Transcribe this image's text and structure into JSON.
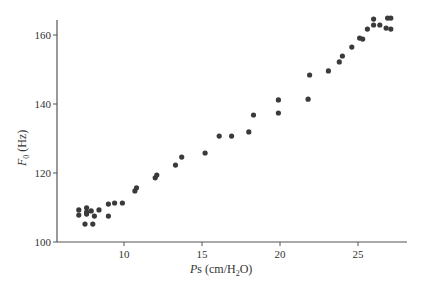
{
  "chart_data": {
    "type": "scatter",
    "title": "",
    "xlabel": "Ps (cm/H2O)",
    "ylabel": "F0 (Hz)",
    "xlabel_parts": {
      "italic": "P",
      "rest": "s (cm/H",
      "sub": "2",
      "end": "O)"
    },
    "ylabel_parts": {
      "italic": "F",
      "sub": "0",
      "rest": " (Hz)"
    },
    "xlim": [
      5.8,
      28.2
    ],
    "ylim": [
      100,
      166
    ],
    "xticks": [
      10,
      15,
      20,
      25
    ],
    "yticks": [
      100,
      120,
      140,
      160
    ],
    "grid": false,
    "legend": null,
    "marker_color": "#3a3a3a",
    "axis_color": "#555555",
    "series": [
      {
        "name": "F0 vs Ps",
        "points": [
          [
            7.1,
            109.3
          ],
          [
            7.1,
            107.8
          ],
          [
            7.6,
            109.9
          ],
          [
            7.6,
            108.7
          ],
          [
            7.6,
            108.1
          ],
          [
            7.9,
            109.0
          ],
          [
            8.4,
            109.3
          ],
          [
            8.1,
            107.5
          ],
          [
            7.5,
            105.2
          ],
          [
            8.0,
            105.2
          ],
          [
            9.0,
            107.5
          ],
          [
            9.0,
            111.0
          ],
          [
            9.4,
            111.3
          ],
          [
            9.9,
            111.3
          ],
          [
            10.7,
            114.8
          ],
          [
            10.8,
            115.7
          ],
          [
            12.0,
            118.6
          ],
          [
            12.1,
            119.4
          ],
          [
            13.3,
            122.3
          ],
          [
            13.7,
            124.6
          ],
          [
            15.2,
            125.8
          ],
          [
            16.1,
            130.7
          ],
          [
            16.9,
            130.7
          ],
          [
            18.0,
            131.9
          ],
          [
            18.3,
            136.8
          ],
          [
            19.9,
            141.2
          ],
          [
            19.9,
            137.4
          ],
          [
            21.8,
            141.4
          ],
          [
            21.9,
            148.4
          ],
          [
            23.1,
            149.6
          ],
          [
            23.8,
            152.2
          ],
          [
            24.0,
            153.9
          ],
          [
            24.6,
            156.5
          ],
          [
            25.1,
            159.1
          ],
          [
            25.3,
            158.8
          ],
          [
            25.6,
            161.7
          ],
          [
            26.0,
            162.9
          ],
          [
            26.0,
            164.6
          ],
          [
            26.4,
            162.9
          ],
          [
            26.8,
            162.0
          ],
          [
            27.1,
            161.7
          ],
          [
            26.9,
            164.9
          ],
          [
            27.1,
            164.9
          ]
        ]
      }
    ]
  }
}
